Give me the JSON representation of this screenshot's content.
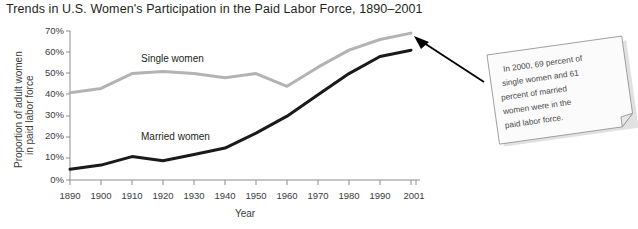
{
  "chart_data": {
    "type": "line",
    "title": "Trends in U.S. Women's Participation in the Paid Labor Force, 1890–2001",
    "xlabel": "Year",
    "ylabel_line1": "Proportion of adult women",
    "ylabel_line2": "in paid labor force",
    "x": [
      1890,
      1900,
      1910,
      1920,
      1930,
      1940,
      1950,
      1960,
      1970,
      1980,
      1990,
      2001
    ],
    "categories": [
      "1890",
      "1900",
      "1910",
      "1920",
      "1930",
      "1940",
      "1950",
      "1960",
      "1970",
      "1980",
      "1990",
      "2001"
    ],
    "ylim": [
      0,
      70
    ],
    "yticks": [
      0,
      10,
      20,
      30,
      40,
      50,
      60,
      70
    ],
    "ytick_labels": [
      "0%",
      "10%",
      "20%",
      "30%",
      "40%",
      "50%",
      "60%",
      "70%"
    ],
    "grid": false,
    "legend_position": "inline-labels",
    "series": [
      {
        "name": "Single women",
        "color": "#b3b3b3",
        "values": [
          41,
          43,
          50,
          51,
          50,
          48,
          50,
          44,
          53,
          61,
          66,
          69
        ]
      },
      {
        "name": "Married women",
        "color": "#1a1a1a",
        "values": [
          5,
          7,
          11,
          9,
          12,
          15,
          22,
          30,
          40,
          50,
          58,
          61
        ]
      }
    ],
    "annotations": [
      {
        "name": "callout-note",
        "text_lines": [
          "In 2000, 69 percent of",
          "single women and 61",
          "percent of married",
          "women were in the",
          "paid labor force."
        ],
        "arrow_points_to": [
          413,
          40
        ]
      }
    ]
  }
}
